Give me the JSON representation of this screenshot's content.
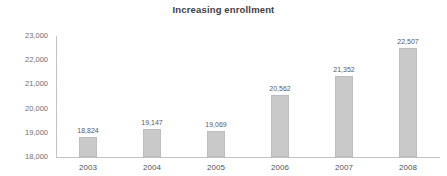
{
  "chart_data": {
    "type": "bar",
    "title": "Increasing enrollment",
    "xlabel": "",
    "ylabel": "",
    "categories": [
      "2003",
      "2004",
      "2005",
      "2006",
      "2007",
      "2008"
    ],
    "values": [
      18824,
      19147,
      19069,
      20562,
      21352,
      22507
    ],
    "value_labels": [
      "18,824",
      "19,147",
      "19,069",
      "20,562",
      "21,352",
      "22,507"
    ],
    "ylim": [
      18000,
      23000
    ],
    "ytick_values": [
      18000,
      19000,
      20000,
      21000,
      22000,
      23000
    ],
    "ytick_labels": [
      "18,000",
      "19,000",
      "20,000",
      "21,000",
      "22,000",
      "23,000"
    ],
    "grid": false,
    "legend": false,
    "legend_position": "none",
    "bar_color": "#c9c9c9",
    "bar_edge_color": "#bdbdbd",
    "axis_color": "#c2c2c2",
    "title_color": "#404040",
    "tick_label_color": "#6e6e6e",
    "data_label_color": "#5a5a5a",
    "background_color": "#ffffff"
  }
}
